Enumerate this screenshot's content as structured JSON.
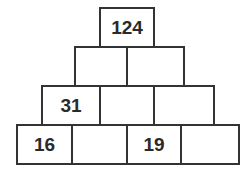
{
  "rows": [
    [
      "124"
    ],
    [
      "",
      ""
    ],
    [
      "31",
      "",
      ""
    ],
    [
      "16",
      "",
      "19",
      ""
    ]
  ],
  "colors": {
    "border": "#333333",
    "text": "#2a2a2a",
    "background": "#ffffff"
  }
}
